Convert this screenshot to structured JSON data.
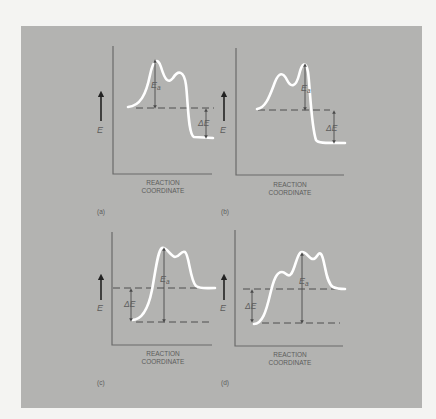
{
  "figure": {
    "panels": [
      {
        "id": "a",
        "caption": "(a)",
        "y_label": "E",
        "x_label_line1": "REACTION",
        "x_label_line2": "COORDINATE",
        "activation_label": "Ea",
        "delta_label": "ΔE",
        "reaction_type": "exothermic, first peak highest"
      },
      {
        "id": "b",
        "caption": "(b)",
        "y_label": "E",
        "x_label_line1": "REACTION",
        "x_label_line2": "COORDINATE",
        "activation_label": "Ea",
        "delta_label": "ΔE",
        "reaction_type": "exothermic, second peak highest"
      },
      {
        "id": "c",
        "caption": "(c)",
        "y_label": "E",
        "x_label_line1": "REACTION",
        "x_label_line2": "COORDINATE",
        "activation_label": "Ea",
        "delta_label": "ΔE",
        "reaction_type": "endothermic, first peak highest"
      },
      {
        "id": "d",
        "caption": "(d)",
        "y_label": "E",
        "x_label_line1": "REACTION",
        "x_label_line2": "COORDINATE",
        "activation_label": "Ea",
        "delta_label": "ΔE",
        "reaction_type": "endothermic, three peaks, middle highest"
      }
    ],
    "colors": {
      "background": "#b3b3b1",
      "page": "#f4f4f2",
      "curve": "#ffffff",
      "axis": "#6a6a6a"
    }
  }
}
